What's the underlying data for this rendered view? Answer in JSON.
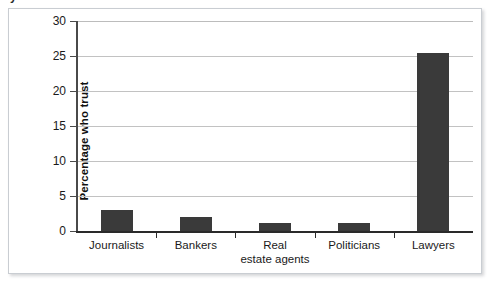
{
  "figure": {
    "cut_off_caption": "y",
    "frame_color": "#c9cdd2",
    "bar_color": "#3a3a3a",
    "gridline_color": "#c2c2c2",
    "axis_color": "#2a2a2a"
  },
  "chart_data": {
    "type": "bar",
    "title": "",
    "xlabel": "",
    "ylabel": "Percentage who trust",
    "categories": [
      "Journalists",
      "Bankers",
      "Real estate agents",
      "Politicians",
      "Lawyers"
    ],
    "category_lines": [
      [
        "Journalists"
      ],
      [
        "Bankers"
      ],
      [
        "Real",
        "estate agents"
      ],
      [
        "Politicians"
      ],
      [
        "Lawyers"
      ]
    ],
    "values": [
      3.0,
      2.0,
      1.1,
      1.2,
      25.4
    ],
    "ylim": [
      0,
      30
    ],
    "ytick_labels": [
      "0",
      "5",
      "10",
      "15",
      "20",
      "25",
      "30"
    ],
    "ytick_values": [
      0,
      5,
      10,
      15,
      20,
      25,
      30
    ],
    "grid": true,
    "grid_axis": "y",
    "legend": false,
    "legend_position": "none",
    "series": [
      {
        "name": "Percentage who trust",
        "values": [
          3.0,
          2.0,
          1.1,
          1.2,
          25.4
        ]
      }
    ]
  }
}
